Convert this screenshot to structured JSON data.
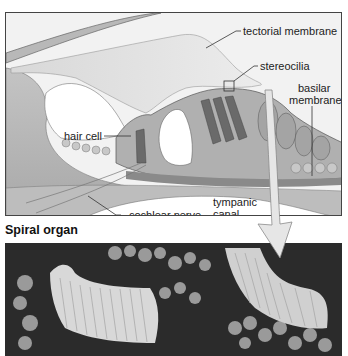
{
  "figure": {
    "caption": "Spiral organ",
    "labels": {
      "tectorial_membrane": "tectorial membrane",
      "stereocilia": "stereocilia",
      "basilar_membrane_1": "basilar",
      "basilar_membrane_2": "membrane",
      "hair_cell": "hair cell",
      "cochlear_nerve": "cochlear nerve",
      "tympanic_canal_1": "tympanic",
      "tympanic_canal_2": "canal"
    },
    "panels": {
      "illustration": "spiral-organ-illustration",
      "micrograph": "stereocilia-micrograph"
    },
    "colors": {
      "background": "#ffffff",
      "illustration_bg": "#f2f2f2",
      "tissue_light": "#cfcfcf",
      "tissue_mid": "#9a9a9a",
      "tissue_dark": "#5a5a5a",
      "photo_bg": "#2b2b2b",
      "arrow_fill": "#e6e6e6"
    }
  }
}
